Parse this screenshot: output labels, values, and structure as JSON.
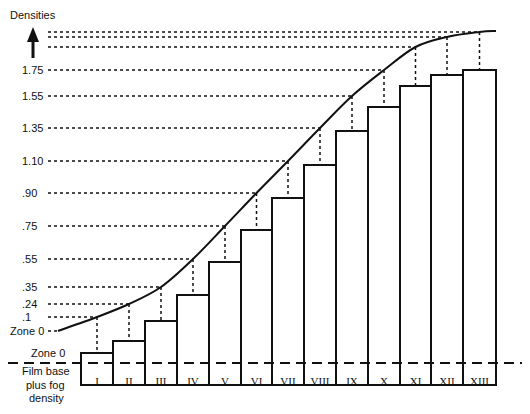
{
  "chart_data": {
    "type": "diagram",
    "title": "",
    "ylabel": "Densities",
    "density_labels": [
      {
        "label": "1.75",
        "y": 70
      },
      {
        "label": "1.55",
        "y": 96
      },
      {
        "label": "1.35",
        "y": 128
      },
      {
        "label": "1.10",
        "y": 161
      },
      {
        "label": ".90",
        "y": 193
      },
      {
        "label": ".75",
        "y": 226
      },
      {
        "label": ".55",
        "y": 259
      },
      {
        "label": ".35",
        "y": 287
      },
      {
        "label": ".24",
        "y": 304
      },
      {
        "label": ".1",
        "y": 317
      },
      {
        "label": "Zone 0",
        "y": 331
      }
    ],
    "upper_unlabeled_lines_y": [
      32,
      37,
      47
    ],
    "baseline_label": [
      "Zone 0",
      "Film base",
      "plus fog",
      "density"
    ],
    "zones": [
      "I",
      "II",
      "III",
      "IV",
      "V",
      "VI",
      "VII",
      "VIII",
      "IX",
      "X",
      "XI",
      "XII",
      "XIII"
    ],
    "bar_tops_y": [
      353,
      341,
      321,
      295,
      262,
      230,
      198,
      165,
      131,
      107,
      86,
      75,
      70
    ],
    "curve_points_y": [
      317,
      304,
      287,
      259,
      226,
      193,
      161,
      128,
      96,
      70,
      47,
      37,
      32
    ]
  },
  "labels": {
    "densities": "Densities",
    "zone0_left": "Zone 0",
    "base_zone0": "Zone 0",
    "base_line1": "Film base",
    "base_line2": "plus fog",
    "base_line3": "density"
  }
}
